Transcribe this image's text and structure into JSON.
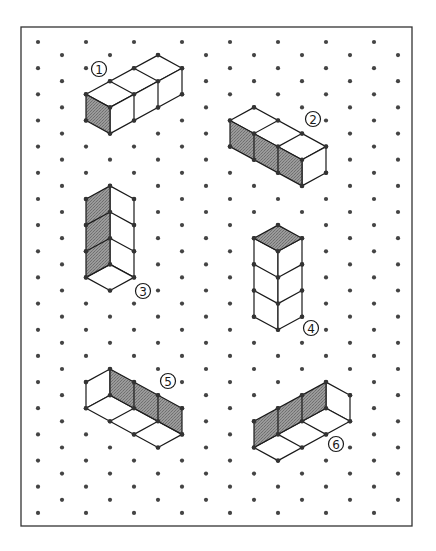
{
  "diagram": {
    "type": "isometric-dot-grid-worksheet",
    "frame": {
      "x": 21,
      "y": 27,
      "width": 391,
      "height": 499
    },
    "grid": {
      "origin_x": 38,
      "origin_y": 42,
      "col_step": 24,
      "half_row_step": 13.08,
      "columns": 16,
      "max_half_row": 36
    },
    "colors": {
      "dot": "#444444",
      "line": "#1a1a1a",
      "shade": "#8a8a8a",
      "background": "#ffffff"
    },
    "shapes": [
      {
        "id": 1,
        "label": "1",
        "label_glyph": "①",
        "label_pos": [
          99,
          69
        ],
        "description": "Three cubes in a row extending up-right, viewed from above; left end face shaded",
        "shaded_faces": [
          [
            [
              2,
              4
            ],
            [
              3,
              5
            ],
            [
              3,
              7
            ],
            [
              2,
              6
            ]
          ]
        ],
        "white_faces": [
          [
            [
              2,
              4
            ],
            [
              5,
              1
            ],
            [
              6,
              2
            ],
            [
              3,
              5
            ]
          ],
          [
            [
              3,
              5
            ],
            [
              6,
              2
            ],
            [
              6,
              4
            ],
            [
              3,
              7
            ]
          ]
        ],
        "edges": [
          [
            [
              3,
              3
            ],
            [
              4,
              4
            ]
          ],
          [
            [
              4,
              2
            ],
            [
              5,
              3
            ]
          ],
          [
            [
              4,
              4
            ],
            [
              4,
              6
            ]
          ],
          [
            [
              5,
              3
            ],
            [
              5,
              5
            ]
          ]
        ],
        "vertices": [
          [
            2,
            4
          ],
          [
            3,
            3
          ],
          [
            4,
            2
          ],
          [
            5,
            1
          ],
          [
            6,
            2
          ],
          [
            6,
            4
          ],
          [
            5,
            3
          ],
          [
            5,
            5
          ],
          [
            4,
            4
          ],
          [
            4,
            6
          ],
          [
            3,
            5
          ],
          [
            3,
            7
          ],
          [
            2,
            6
          ]
        ]
      },
      {
        "id": 2,
        "label": "2",
        "label_glyph": "②",
        "label_pos": [
          313,
          119
        ],
        "description": "Three cubes in a row extending down-right, viewed from above; front faces shaded",
        "shaded_faces": [
          [
            [
              8,
              6
            ],
            [
              11,
              9
            ],
            [
              11,
              11
            ],
            [
              8,
              8
            ]
          ]
        ],
        "white_faces": [
          [
            [
              8,
              6
            ],
            [
              9,
              5
            ],
            [
              12,
              8
            ],
            [
              11,
              9
            ]
          ],
          [
            [
              11,
              9
            ],
            [
              12,
              8
            ],
            [
              12,
              10
            ],
            [
              11,
              11
            ]
          ]
        ],
        "edges": [
          [
            [
              9,
              7
            ],
            [
              10,
              6
            ]
          ],
          [
            [
              10,
              8
            ],
            [
              11,
              7
            ]
          ],
          [
            [
              9,
              7
            ],
            [
              9,
              9
            ]
          ],
          [
            [
              10,
              8
            ],
            [
              10,
              10
            ]
          ]
        ],
        "vertices": [
          [
            8,
            6
          ],
          [
            9,
            5
          ],
          [
            10,
            6
          ],
          [
            11,
            7
          ],
          [
            12,
            8
          ],
          [
            12,
            10
          ],
          [
            11,
            11
          ],
          [
            11,
            9
          ],
          [
            8,
            8
          ],
          [
            9,
            7
          ],
          [
            10,
            8
          ],
          [
            9,
            9
          ],
          [
            10,
            10
          ]
        ]
      },
      {
        "id": 3,
        "label": "3",
        "label_glyph": "③",
        "label_pos": [
          143,
          291
        ],
        "description": "Vertical stack of three cubes viewed from below; left faces shaded",
        "shaded_faces": [
          [
            [
              2,
              12
            ],
            [
              3,
              11
            ],
            [
              3,
              17
            ],
            [
              2,
              18
            ]
          ]
        ],
        "white_faces": [
          [
            [
              3,
              11
            ],
            [
              4,
              12
            ],
            [
              4,
              18
            ],
            [
              3,
              17
            ]
          ],
          [
            [
              2,
              18
            ],
            [
              3,
              17
            ],
            [
              4,
              18
            ],
            [
              3,
              19
            ]
          ]
        ],
        "edges": [
          [
            [
              2,
              14
            ],
            [
              3,
              13
            ]
          ],
          [
            [
              3,
              13
            ],
            [
              4,
              14
            ]
          ],
          [
            [
              2,
              16
            ],
            [
              3,
              15
            ]
          ],
          [
            [
              3,
              15
            ],
            [
              4,
              16
            ]
          ]
        ],
        "vertices": [
          [
            2,
            12
          ],
          [
            3,
            11
          ],
          [
            4,
            12
          ],
          [
            4,
            14
          ],
          [
            4,
            16
          ],
          [
            4,
            18
          ],
          [
            3,
            19
          ],
          [
            2,
            18
          ],
          [
            2,
            16
          ],
          [
            2,
            14
          ],
          [
            3,
            13
          ],
          [
            3,
            15
          ],
          [
            3,
            17
          ]
        ]
      },
      {
        "id": 4,
        "label": "4",
        "label_glyph": "④",
        "label_pos": [
          311,
          328
        ],
        "description": "Vertical stack of three cubes viewed from above; top face shaded",
        "shaded_faces": [
          [
            [
              9,
              15
            ],
            [
              10,
              14
            ],
            [
              11,
              15
            ],
            [
              10,
              16
            ]
          ]
        ],
        "white_faces": [
          [
            [
              9,
              15
            ],
            [
              10,
              16
            ],
            [
              10,
              22
            ],
            [
              9,
              21
            ]
          ],
          [
            [
              10,
              16
            ],
            [
              11,
              15
            ],
            [
              11,
              21
            ],
            [
              10,
              22
            ]
          ]
        ],
        "edges": [
          [
            [
              9,
              17
            ],
            [
              10,
              18
            ]
          ],
          [
            [
              10,
              18
            ],
            [
              11,
              17
            ]
          ],
          [
            [
              9,
              19
            ],
            [
              10,
              20
            ]
          ],
          [
            [
              10,
              20
            ],
            [
              11,
              19
            ]
          ]
        ],
        "vertices": [
          [
            9,
            15
          ],
          [
            10,
            14
          ],
          [
            11,
            15
          ],
          [
            10,
            16
          ],
          [
            9,
            17
          ],
          [
            11,
            17
          ],
          [
            10,
            18
          ],
          [
            9,
            19
          ],
          [
            11,
            19
          ],
          [
            10,
            20
          ],
          [
            9,
            21
          ],
          [
            11,
            21
          ],
          [
            10,
            22
          ]
        ]
      },
      {
        "id": 5,
        "label": "5",
        "label_glyph": "⑤",
        "label_pos": [
          168,
          381
        ],
        "description": "Three cubes in a row extending down-right, viewed from below; back wall shaded",
        "shaded_faces": [
          [
            [
              3,
              25
            ],
            [
              6,
              28
            ],
            [
              6,
              30
            ],
            [
              3,
              27
            ]
          ]
        ],
        "white_faces": [
          [
            [
              2,
              26
            ],
            [
              3,
              25
            ],
            [
              3,
              27
            ],
            [
              2,
              28
            ]
          ],
          [
            [
              2,
              28
            ],
            [
              3,
              27
            ],
            [
              6,
              30
            ],
            [
              5,
              31
            ]
          ]
        ],
        "edges": [
          [
            [
              4,
              26
            ],
            [
              4,
              28
            ]
          ],
          [
            [
              5,
              27
            ],
            [
              5,
              29
            ]
          ],
          [
            [
              3,
              29
            ],
            [
              4,
              28
            ]
          ],
          [
            [
              4,
              30
            ],
            [
              5,
              29
            ]
          ]
        ],
        "vertices": [
          [
            2,
            26
          ],
          [
            3,
            25
          ],
          [
            4,
            26
          ],
          [
            5,
            27
          ],
          [
            6,
            28
          ],
          [
            6,
            30
          ],
          [
            5,
            31
          ],
          [
            4,
            30
          ],
          [
            3,
            29
          ],
          [
            2,
            28
          ],
          [
            3,
            27
          ],
          [
            4,
            28
          ],
          [
            5,
            29
          ]
        ]
      },
      {
        "id": 6,
        "label": "6",
        "label_glyph": "⑥",
        "label_pos": [
          336,
          444
        ],
        "description": "Three cubes in a row extending up-right, viewed from below; back wall shaded",
        "shaded_faces": [
          [
            [
              9,
              29
            ],
            [
              12,
              26
            ],
            [
              12,
              28
            ],
            [
              9,
              31
            ]
          ]
        ],
        "white_faces": [
          [
            [
              12,
              26
            ],
            [
              13,
              27
            ],
            [
              13,
              29
            ],
            [
              12,
              28
            ]
          ],
          [
            [
              9,
              31
            ],
            [
              12,
              28
            ],
            [
              13,
              29
            ],
            [
              10,
              32
            ]
          ]
        ],
        "edges": [
          [
            [
              10,
              28
            ],
            [
              10,
              30
            ]
          ],
          [
            [
              11,
              27
            ],
            [
              11,
              29
            ]
          ],
          [
            [
              10,
              30
            ],
            [
              11,
              31
            ]
          ],
          [
            [
              11,
              29
            ],
            [
              12,
              30
            ]
          ]
        ],
        "vertices": [
          [
            9,
            29
          ],
          [
            10,
            28
          ],
          [
            11,
            27
          ],
          [
            12,
            26
          ],
          [
            13,
            27
          ],
          [
            13,
            29
          ],
          [
            12,
            30
          ],
          [
            11,
            31
          ],
          [
            10,
            32
          ],
          [
            9,
            31
          ],
          [
            10,
            30
          ],
          [
            11,
            29
          ],
          [
            12,
            28
          ]
        ]
      }
    ]
  }
}
